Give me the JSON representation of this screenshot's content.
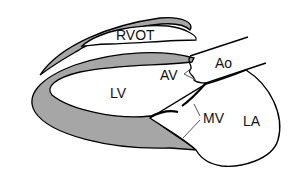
{
  "diagram": {
    "type": "anatomical-schematic",
    "colors": {
      "myocardium_fill": "#a6a6a6",
      "outline": "#000000",
      "chamber_fill": "#ffffff",
      "leader_line": "#555555"
    },
    "labels": {
      "rvot": "RVOT",
      "ao": "Ao",
      "av": "AV",
      "lv": "LV",
      "mv": "MV",
      "la": "LA"
    }
  }
}
